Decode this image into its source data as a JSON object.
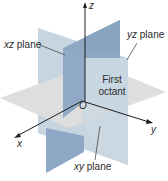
{
  "figure": {
    "type": "3d-coordinate-planes",
    "axes": {
      "x": "x",
      "y": "y",
      "z": "z",
      "origin": "O"
    },
    "labels": {
      "xz_plane": {
        "var": "xz",
        "word": "plane"
      },
      "yz_plane": {
        "var": "yz",
        "word": "plane"
      },
      "xy_plane": {
        "var": "xy",
        "word": "plane"
      },
      "first_octant_line1": "First",
      "first_octant_line2": "octant"
    },
    "colors": {
      "background": "#ffffff",
      "xy_plane": "#dcdcdc",
      "yz_plane": "#c3d3df",
      "xz_plane": "#8fa9c6",
      "xz_plane_upper": "#9db4cc",
      "axis": "#1e1e1e",
      "text": "#2b2b2b"
    }
  }
}
